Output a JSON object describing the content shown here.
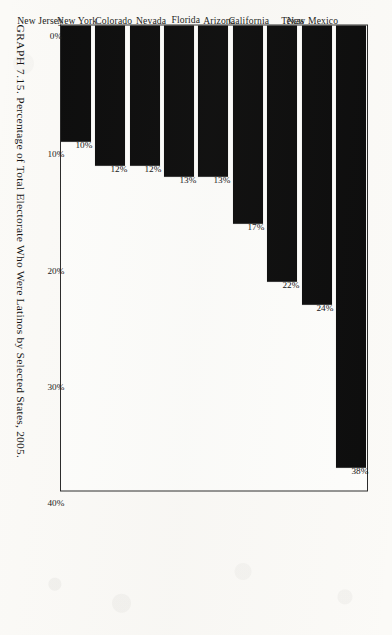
{
  "figure": {
    "caption_label": "GRAPH 7.15.",
    "caption_text": "Percentage of Total Electorate Who Were Latinos by Selected States, 2005."
  },
  "chart_data": {
    "type": "bar",
    "orientation": "vertical",
    "title": "Percentage of Total Electorate Who Were Latinos by Selected States, 2005",
    "xlabel": "",
    "ylabel": "",
    "ylim": [
      0,
      40
    ],
    "grid": false,
    "legend": null,
    "tick_labels": [
      "0%",
      "10%",
      "20%",
      "30%",
      "40%"
    ],
    "tick_values": [
      0,
      10,
      20,
      30,
      40
    ],
    "categories": [
      "New Mexico",
      "Texas",
      "California",
      "Arizona",
      "Florida",
      "Nevada",
      "Colorado",
      "New York",
      "New Jersey"
    ],
    "values": [
      38,
      24,
      22,
      17,
      13,
      13,
      12,
      12,
      10
    ],
    "value_labels": [
      "38%",
      "24%",
      "22%",
      "17%",
      "13%",
      "13%",
      "12%",
      "12%",
      "10%"
    ],
    "bar_color": "#0d0d0d",
    "background_color": "#fbfaf7"
  }
}
